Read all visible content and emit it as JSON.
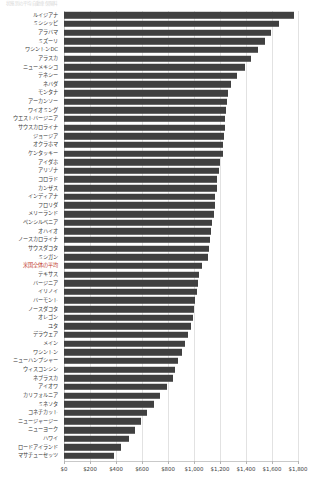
{
  "chart_data": {
    "type": "bar",
    "orientation": "horizontal",
    "title": "状態別の平均自動車保険料",
    "xlabel": "",
    "ylabel": "",
    "xlim": [
      0,
      1800
    ],
    "grid": true,
    "legend": "none",
    "highlight_color": "#c0392b",
    "bar_color": "#404040",
    "tick_labels": [
      "$0",
      "$200",
      "$400",
      "$600",
      "$800",
      "$1,000",
      "$1,200",
      "$1,400",
      "$1,600",
      "$1,800"
    ],
    "tick_values": [
      0,
      200,
      400,
      600,
      800,
      1000,
      1200,
      1400,
      1600,
      1800
    ],
    "categories": [
      "ルイジアナ",
      "ミシシッピ",
      "アラバマ",
      "ミズーリ",
      "ワシントンDC",
      "アラスカ",
      "ニューメキシコ",
      "テネシー",
      "ネバダ",
      "モンタナ",
      "アーカンソー",
      "ワイオミング",
      "ウエストバージニア",
      "サウスカロライナ",
      "ジョージア",
      "オクラホマ",
      "ケンタッキー",
      "アイダホ",
      "アリゾナ",
      "コロラド",
      "カンザス",
      "インディアナ",
      "フロリダ",
      "メリーランド",
      "ペンシルベニア",
      "オハイオ",
      "ノースカロライナ",
      "サウスダコタ",
      "ミシガン",
      "米国全体の平均",
      "テキサス",
      "バージニア",
      "イリノイ",
      "バーモント",
      "ノースダコタ",
      "オレゴン",
      "ユタ",
      "デラウェア",
      "メイン",
      "ワシントン",
      "ニューハンプシャー",
      "ウィスコンシン",
      "ネブラスカ",
      "アイオワ",
      "カリフォルニア",
      "ミネソタ",
      "コネチカット",
      "ニュージャージー",
      "ニューヨーク",
      "ハワイ",
      "ロードアイランド",
      "マサチューセッツ"
    ],
    "values": [
      1770,
      1650,
      1590,
      1545,
      1490,
      1435,
      1390,
      1330,
      1285,
      1260,
      1250,
      1245,
      1240,
      1235,
      1230,
      1225,
      1220,
      1200,
      1190,
      1180,
      1175,
      1165,
      1160,
      1150,
      1140,
      1130,
      1125,
      1115,
      1105,
      1060,
      1040,
      1030,
      1020,
      1010,
      1000,
      990,
      975,
      955,
      930,
      905,
      880,
      855,
      835,
      790,
      735,
      690,
      640,
      595,
      545,
      500,
      440,
      385
    ],
    "highlight_category": "米国全体の平均"
  }
}
